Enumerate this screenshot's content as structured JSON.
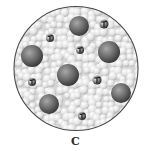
{
  "figure": {
    "panel_label": "C",
    "container": {
      "shape": "circle",
      "cx": 76,
      "cy": 68.5,
      "r": 62,
      "stroke": "#555555",
      "fill": "#dcdcdc"
    },
    "colors": {
      "small_particle_light": "#f4f4f4",
      "small_particle_mid": "#c8c8c8",
      "large_particle_highlight": "#9a9a9a",
      "large_particle_shadow": "#3e3e3e",
      "molecule_dark": "#222222"
    },
    "large_particles": [
      {
        "cx": 79,
        "cy": 26,
        "r": 10
      },
      {
        "cx": 32,
        "cy": 56,
        "r": 11
      },
      {
        "cx": 109,
        "cy": 52,
        "r": 11
      },
      {
        "cx": 68,
        "cy": 75,
        "r": 11
      },
      {
        "cx": 49,
        "cy": 104,
        "r": 10
      },
      {
        "cx": 121,
        "cy": 93,
        "r": 10
      }
    ],
    "small_molecules": [
      {
        "cx": 104,
        "cy": 24,
        "r": 4.5
      },
      {
        "cx": 50,
        "cy": 38,
        "r": 4
      },
      {
        "cx": 80,
        "cy": 50,
        "r": 4
      },
      {
        "cx": 32,
        "cy": 82,
        "r": 4
      },
      {
        "cx": 97,
        "cy": 80,
        "r": 4.5
      },
      {
        "cx": 82,
        "cy": 116,
        "r": 4
      }
    ]
  }
}
